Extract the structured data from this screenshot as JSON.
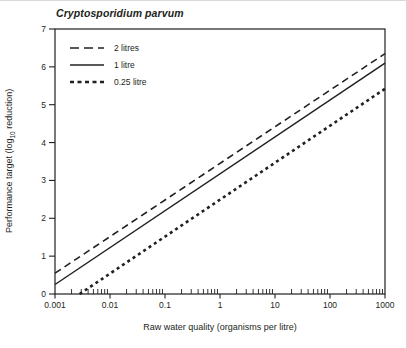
{
  "figure": {
    "title": "Cryptosporidium parvum",
    "x_axis_label": "Raw water quality (organisms per litre)",
    "y_axis_label_prefix": "Performance target (log",
    "y_axis_label_sub": "10",
    "y_axis_label_suffix": " reduction)"
  },
  "colors": {
    "ink": "#231f20",
    "background": "#ffffff"
  },
  "chart_data": {
    "type": "line",
    "title": "Cryptosporidium parvum",
    "xlabel": "Raw water quality (organisms per litre)",
    "ylabel": "Performance target (log10 reduction)",
    "x_scale": "log",
    "y_scale": "linear",
    "xlim": [
      0.001,
      1000
    ],
    "ylim": [
      0,
      7
    ],
    "x_ticks": [
      0.001,
      0.01,
      0.1,
      1,
      10,
      100,
      1000
    ],
    "x_tick_labels": [
      "0.001",
      "0.01",
      "0.1",
      "1",
      "10",
      "100",
      "1000"
    ],
    "y_ticks": [
      0,
      1,
      2,
      3,
      4,
      5,
      6,
      7
    ],
    "y_tick_labels": [
      "0",
      "1",
      "2",
      "3",
      "4",
      "5",
      "6",
      "7"
    ],
    "grid": false,
    "frame": "box",
    "legend_position": "top-left-inside",
    "series": [
      {
        "name": "2 litres",
        "style": "dashed",
        "color": "#231f20",
        "stroke_width": 1.6,
        "dash": "7 4.5",
        "legend_dash": "9 5",
        "points": [
          [
            0.001,
            0.55
          ],
          [
            1000,
            6.35
          ]
        ]
      },
      {
        "name": "1 litre",
        "style": "solid",
        "color": "#231f20",
        "stroke_width": 1.5,
        "dash": "",
        "legend_dash": "",
        "points": [
          [
            0.001,
            0.25
          ],
          [
            1000,
            6.1
          ]
        ]
      },
      {
        "name": "0.25 litre",
        "style": "bold-dashed",
        "color": "#231f20",
        "stroke_width": 2.6,
        "dash": "3 3.4",
        "legend_dash": "4 3.5",
        "points": [
          [
            0.0028,
            0.0
          ],
          [
            1000,
            5.42
          ]
        ]
      }
    ]
  }
}
